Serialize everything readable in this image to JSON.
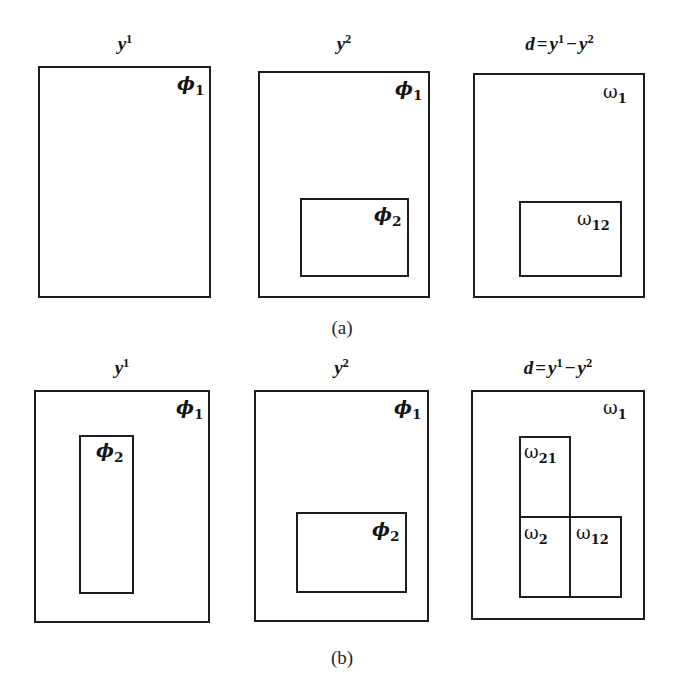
{
  "figure": {
    "background": "#ffffff",
    "stroke_color": "#1d1d1d",
    "rows": [
      {
        "caption": "(a)",
        "panels": [
          {
            "title_parts": {
              "base": "y",
              "sup": "1"
            },
            "title_text": "y1",
            "regions": [
              {
                "name": "phi-1",
                "text": "ϕ",
                "sub": "1"
              }
            ]
          },
          {
            "title_parts": {
              "base": "y",
              "sup": "2"
            },
            "title_text": "y2",
            "regions": [
              {
                "name": "phi-1",
                "text": "ϕ",
                "sub": "1"
              },
              {
                "name": "phi-2",
                "text": "ϕ",
                "sub": "2"
              }
            ]
          },
          {
            "title_parts": {
              "lhs": "d",
              "op": "=",
              "base1": "y",
              "sup1": "1",
              "minus": "−",
              "base2": "y",
              "sup2": "2"
            },
            "title_text": "d = y1 - y2",
            "regions": [
              {
                "name": "omega-1",
                "text": "ω",
                "sub": "1"
              },
              {
                "name": "omega-12",
                "text": "ω",
                "sub": "12"
              }
            ]
          }
        ]
      },
      {
        "caption": "(b)",
        "panels": [
          {
            "title_parts": {
              "base": "y",
              "sup": "1"
            },
            "title_text": "y1",
            "regions": [
              {
                "name": "phi-1",
                "text": "ϕ",
                "sub": "1"
              },
              {
                "name": "phi-2",
                "text": "ϕ",
                "sub": "2"
              }
            ]
          },
          {
            "title_parts": {
              "base": "y",
              "sup": "2"
            },
            "title_text": "y2",
            "regions": [
              {
                "name": "phi-1",
                "text": "ϕ",
                "sub": "1"
              },
              {
                "name": "phi-2",
                "text": "ϕ",
                "sub": "2"
              }
            ]
          },
          {
            "title_parts": {
              "lhs": "d",
              "op": "=",
              "base1": "y",
              "sup1": "1",
              "minus": "−",
              "base2": "y",
              "sup2": "2"
            },
            "title_text": "d = y1 - y2",
            "regions": [
              {
                "name": "omega-1",
                "text": "ω",
                "sub": "1"
              },
              {
                "name": "omega-21",
                "text": "ω",
                "sub": "21"
              },
              {
                "name": "omega-2",
                "text": "ω",
                "sub": "2"
              },
              {
                "name": "omega-12",
                "text": "ω",
                "sub": "12"
              }
            ]
          }
        ]
      }
    ]
  },
  "labels": {
    "y_base": "y",
    "sup_1": "1",
    "sup_2": "2",
    "d": "d",
    "equals": "=",
    "minus": "−",
    "phi": "ϕ",
    "omega": "ω",
    "sub_1": "1",
    "sub_2": "2",
    "sub_12": "12",
    "sub_21": "21",
    "caption_a": "(a)",
    "caption_b": "(b)"
  }
}
